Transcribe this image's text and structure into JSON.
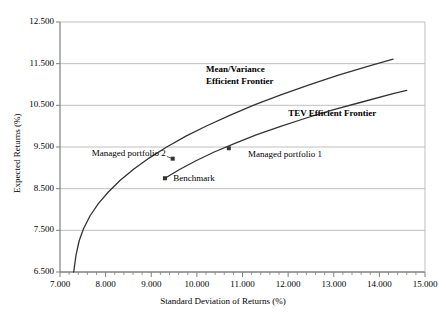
{
  "chart_data": {
    "type": "line",
    "title": "",
    "xlabel": "Standard Deviation of Returns (%)",
    "ylabel": "Expected Returns (%)",
    "xlim": [
      7.0,
      15.0
    ],
    "ylim": [
      6.5,
      12.5
    ],
    "xticks": [
      "7.000",
      "8.000",
      "9.000",
      "10.000",
      "11.000",
      "12.000",
      "13.000",
      "14.000",
      "15.000"
    ],
    "yticks": [
      "6.500",
      "7.500",
      "8.500",
      "9.500",
      "10.500",
      "11.500",
      "12.500"
    ],
    "xtick_values": [
      7.0,
      8.0,
      9.0,
      10.0,
      11.0,
      12.0,
      13.0,
      14.0,
      15.0
    ],
    "ytick_values": [
      6.5,
      7.5,
      8.5,
      9.5,
      10.5,
      11.5,
      12.5
    ],
    "minor_xtick_step": 0.2,
    "grid": "horizontal",
    "legend": "none",
    "line_color": "#333333",
    "grid_color": "#bfbfbf",
    "axis_color": "#808080",
    "series": [
      {
        "name": "Mean/Variance Efficient Frontier",
        "points": [
          [
            7.3,
            6.5
          ],
          [
            7.35,
            6.9
          ],
          [
            7.42,
            7.25
          ],
          [
            7.52,
            7.55
          ],
          [
            7.66,
            7.85
          ],
          [
            7.84,
            8.14
          ],
          [
            8.06,
            8.42
          ],
          [
            8.32,
            8.7
          ],
          [
            8.62,
            8.97
          ],
          [
            8.96,
            9.24
          ],
          [
            9.34,
            9.5
          ],
          [
            9.76,
            9.76
          ],
          [
            10.22,
            10.01
          ],
          [
            10.72,
            10.26
          ],
          [
            11.26,
            10.51
          ],
          [
            11.84,
            10.75
          ],
          [
            12.46,
            10.99
          ],
          [
            13.12,
            11.23
          ],
          [
            13.82,
            11.46
          ],
          [
            14.3,
            11.61
          ]
        ]
      },
      {
        "name": "TEV Efficient Frontier",
        "points": [
          [
            9.3,
            8.75
          ],
          [
            9.62,
            8.96
          ],
          [
            9.98,
            9.17
          ],
          [
            10.38,
            9.38
          ],
          [
            10.82,
            9.58
          ],
          [
            11.3,
            9.79
          ],
          [
            11.82,
            9.99
          ],
          [
            12.38,
            10.19
          ],
          [
            12.98,
            10.39
          ],
          [
            13.62,
            10.58
          ],
          [
            14.3,
            10.78
          ],
          [
            14.6,
            10.86
          ]
        ]
      }
    ],
    "points": [
      {
        "name": "Benchmark",
        "x": 9.3,
        "y": 8.75,
        "label": "Benchmark",
        "label_x": 9.48,
        "label_y": 8.72,
        "anchor": "start"
      },
      {
        "name": "Managed portfolio 2",
        "x": 9.47,
        "y": 9.22,
        "label": "Managed portfolio 2",
        "label_x": 9.32,
        "label_y": 9.32,
        "anchor": "end"
      },
      {
        "name": "Managed portfolio 1",
        "x": 10.7,
        "y": 9.47,
        "label": "Managed portfolio 1",
        "label_x": 11.12,
        "label_y": 9.28,
        "anchor": "start"
      }
    ],
    "annotations": [
      {
        "name": "mv-frontier-label",
        "text": "Mean/Variance",
        "x": 10.2,
        "y": 11.33,
        "bold": true
      },
      {
        "name": "mv-frontier-label-2",
        "text": "Efficient Frontier",
        "x": 10.2,
        "y": 11.03,
        "bold": true
      },
      {
        "name": "tev-frontier-label",
        "text": "TEV Efficient Frontier",
        "x": 12.0,
        "y": 10.27,
        "bold": true
      }
    ]
  }
}
